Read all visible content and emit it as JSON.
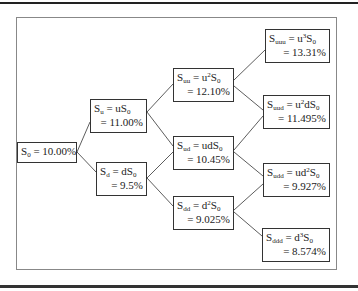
{
  "diagram": {
    "type": "binomial-tree",
    "nodes": {
      "s0": {
        "sub": "0",
        "expr": "",
        "value": "S0 = 10.00%",
        "eq": "= 10.00%"
      },
      "su": {
        "sub": "u",
        "rhs_pre": "uS",
        "rhs_sup": "",
        "rhs_sub": "0",
        "value": "= 11.00%"
      },
      "sd": {
        "sub": "d",
        "rhs_pre": "dS",
        "rhs_sup": "",
        "rhs_sub": "0",
        "value": "= 9.5%"
      },
      "suu": {
        "sub": "uu",
        "rhs_pre": "u",
        "rhs_sup": "2",
        "rhs_mid": "S",
        "rhs_sub": "0",
        "value": "= 12.10%"
      },
      "sud": {
        "sub": "ud",
        "rhs_pre": "udS",
        "rhs_sup": "",
        "rhs_mid": "",
        "rhs_sub": "0",
        "value": "= 10.45%"
      },
      "sdd": {
        "sub": "dd",
        "rhs_pre": "d",
        "rhs_sup": "2",
        "rhs_mid": "S",
        "rhs_sub": "0",
        "value": "= 9.025%"
      },
      "suuu": {
        "sub": "uuu",
        "rhs_pre": "u",
        "rhs_sup": "3",
        "rhs_mid": "S",
        "rhs_sub": "0",
        "value": "= 13.31%"
      },
      "suud": {
        "sub": "uud",
        "rhs_pre": "u",
        "rhs_sup": "2",
        "rhs_mid": "dS",
        "rhs_sub": "0",
        "value": "= 11.495%"
      },
      "sudd": {
        "sub": "udd",
        "rhs_pre": "ud",
        "rhs_sup": "2",
        "rhs_mid": "S",
        "rhs_sub": "0",
        "value": "= 9.927%"
      },
      "sddd": {
        "sub": "ddd",
        "rhs_pre": "d",
        "rhs_sup": "3",
        "rhs_mid": "S",
        "rhs_sub": "0",
        "value": "= 8.574%"
      }
    },
    "symbols": {
      "S": "S",
      "eq": " = "
    },
    "edges": [
      [
        "s0",
        "su"
      ],
      [
        "s0",
        "sd"
      ],
      [
        "su",
        "suu"
      ],
      [
        "su",
        "sud"
      ],
      [
        "sd",
        "sud"
      ],
      [
        "sd",
        "sdd"
      ],
      [
        "suu",
        "suuu"
      ],
      [
        "suu",
        "suud"
      ],
      [
        "sud",
        "suud"
      ],
      [
        "sud",
        "sudd"
      ],
      [
        "sdd",
        "sudd"
      ],
      [
        "sdd",
        "sddd"
      ]
    ]
  }
}
